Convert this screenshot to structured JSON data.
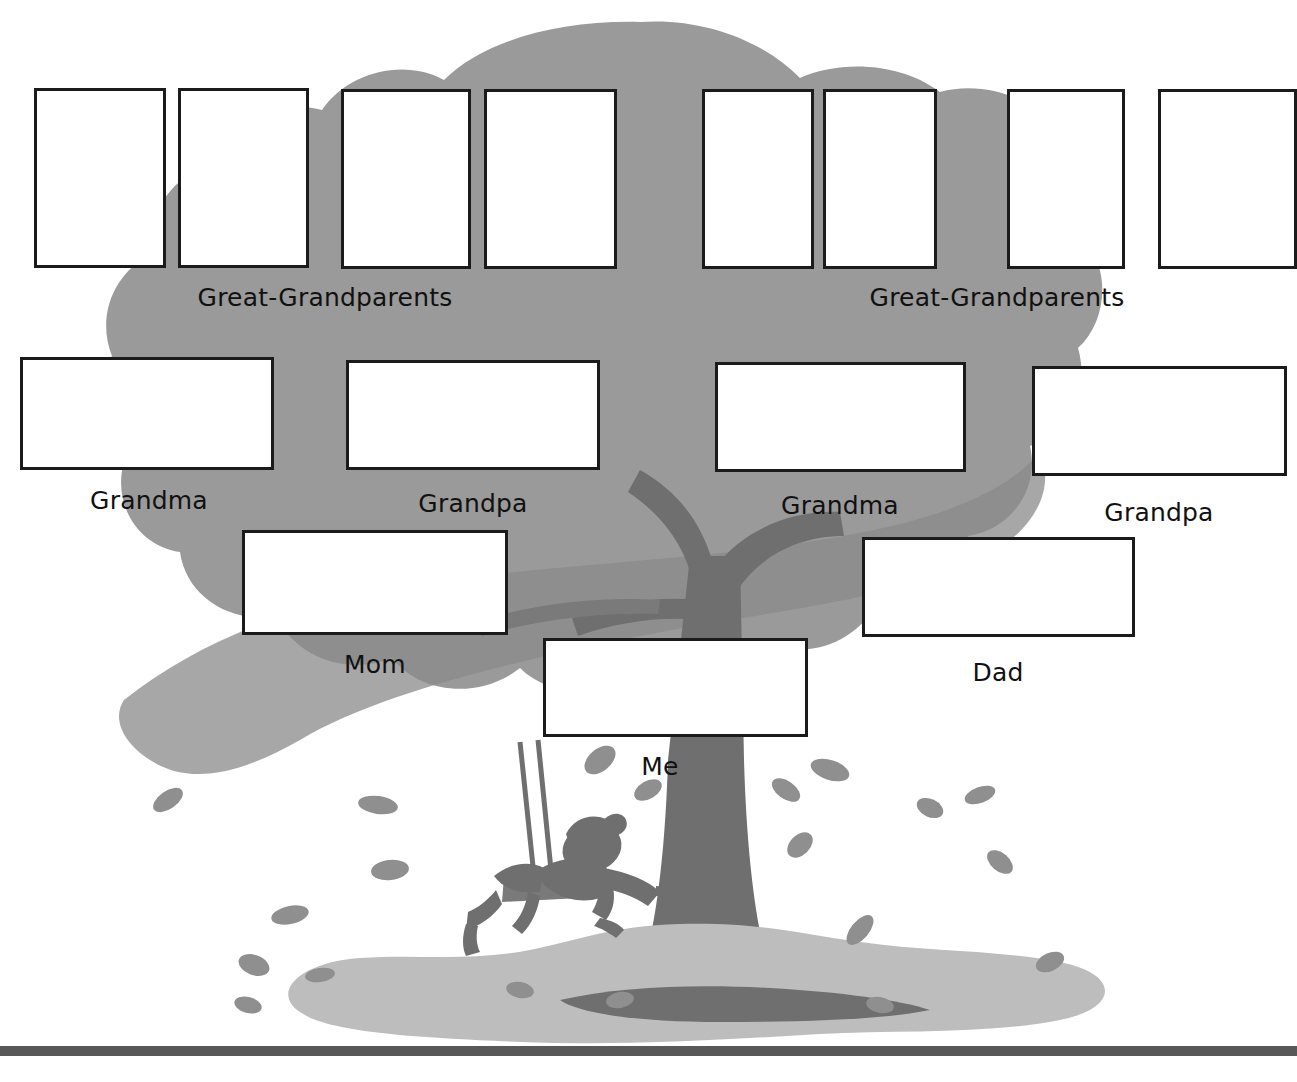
{
  "worksheet": {
    "title": "Family Tree",
    "background_color": "#ffffff",
    "canopy_color": "#9a9a9a",
    "canopy_shadow_color": "#8a8a8a",
    "trunk_color": "#6f6f6f",
    "ground_color": "#bdbdbd",
    "leaf_color": "#8f8f8f",
    "box_border_color": "#1b1b1b",
    "box_fill_color": "#ffffff",
    "text_color": "#111111",
    "baseline_color": "#585858"
  },
  "generations": {
    "great_grandparents": {
      "label_left": "Great-Grandparents",
      "label_right": "Great-Grandparents",
      "boxes": [
        {
          "name": "great-grandparent-box-1",
          "x": 34,
          "y": 88,
          "w": 132,
          "h": 180
        },
        {
          "name": "great-grandparent-box-2",
          "x": 178,
          "y": 88,
          "w": 131,
          "h": 180
        },
        {
          "name": "great-grandparent-box-3",
          "x": 341,
          "y": 89,
          "w": 130,
          "h": 180
        },
        {
          "name": "great-grandparent-box-4",
          "x": 484,
          "y": 89,
          "w": 133,
          "h": 180
        },
        {
          "name": "great-grandparent-box-5",
          "x": 702,
          "y": 89,
          "w": 112,
          "h": 180
        },
        {
          "name": "great-grandparent-box-6",
          "x": 823,
          "y": 89,
          "w": 114,
          "h": 180
        },
        {
          "name": "great-grandparent-box-7",
          "x": 1007,
          "y": 89,
          "w": 118,
          "h": 180
        },
        {
          "name": "great-grandparent-box-8",
          "x": 1158,
          "y": 89,
          "w": 139,
          "h": 180
        }
      ],
      "label_left_x": 325,
      "label_left_y": 283,
      "label_right_x": 997,
      "label_right_y": 283
    },
    "grandparents": {
      "boxes": [
        {
          "name": "grandma-box-maternal",
          "x": 20,
          "y": 357,
          "w": 254,
          "h": 113,
          "label": "Grandma",
          "label_x": 149,
          "label_y": 486
        },
        {
          "name": "grandpa-box-maternal",
          "x": 346,
          "y": 360,
          "w": 254,
          "h": 110,
          "label": "Grandpa",
          "label_x": 473,
          "label_y": 489
        },
        {
          "name": "grandma-box-paternal",
          "x": 715,
          "y": 362,
          "w": 251,
          "h": 110,
          "label": "Grandma",
          "label_x": 840,
          "label_y": 491
        },
        {
          "name": "grandpa-box-paternal",
          "x": 1032,
          "y": 366,
          "w": 255,
          "h": 110,
          "label": "Grandpa",
          "label_x": 1159,
          "label_y": 498
        }
      ]
    },
    "parents": {
      "boxes": [
        {
          "name": "mom-box",
          "x": 242,
          "y": 530,
          "w": 266,
          "h": 105,
          "label": "Mom",
          "label_x": 375,
          "label_y": 650
        },
        {
          "name": "dad-box",
          "x": 862,
          "y": 537,
          "w": 273,
          "h": 100,
          "label": "Dad",
          "label_x": 998,
          "label_y": 658
        }
      ]
    },
    "self": {
      "box": {
        "name": "me-box",
        "x": 543,
        "y": 638,
        "w": 265,
        "h": 99
      },
      "label": "Me",
      "label_x": 660,
      "label_y": 752
    }
  },
  "illustration": {
    "tree_icon": "tree-icon",
    "canopy_icon": "foliage-blob-icon",
    "trunk_icon": "tree-trunk-icon",
    "branch_icon": "tree-branch-icon",
    "swing_icon": "rope-swing-icon",
    "child_icon": "child-on-swing-icon",
    "leaf_icon": "falling-leaf-icon",
    "ground_icon": "ground-patch-icon",
    "baseline_icon": "horizontal-rule-icon",
    "leaf_count": 18
  }
}
